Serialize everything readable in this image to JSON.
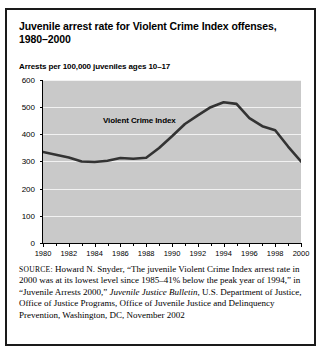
{
  "figure": {
    "title": "Juvenile arrest rate for Violent Crime Index offenses, 1980–2000",
    "axis_note": "Arrests per 100,000 juveniles ages 10–17",
    "series_label": "Violent Crime Index"
  },
  "source": {
    "label": "SOURCE:",
    "text_1": " Howard N. Snyder, “The juvenile Violent Crime Index arrest rate in 2000 was at its lowest level since 1985–41% below the peak year of 1994,” in “Juvenile Arrests 2000,” ",
    "italic_1": "Juvenile Justice Bulletin",
    "text_2": ", U.S. Department of Justice, Office of Justice Programs, Office of Juvenile Justice and Delinquency Prevention, Washington, DC, November 2002"
  },
  "colors": {
    "plot_background": "#c9c9c9",
    "gridline": "#f2f2f2",
    "line": "#333333",
    "border": "#1a1a1a"
  },
  "chart_data": {
    "type": "line",
    "title": "Juvenile arrest rate for Violent Crime Index offenses, 1980–2000",
    "xlabel": "",
    "ylabel": "Arrests per 100,000 juveniles ages 10–17",
    "xlim": [
      1980,
      2000
    ],
    "ylim": [
      0,
      600
    ],
    "yticks": [
      0,
      100,
      200,
      300,
      400,
      500,
      600
    ],
    "xticks": [
      1980,
      1982,
      1984,
      1986,
      1988,
      1990,
      1992,
      1994,
      1996,
      1998,
      2000
    ],
    "xtick_labels": [
      "1980",
      "1982",
      "1984",
      "1986",
      "1988",
      "1990",
      "1992",
      "1994",
      "1996",
      "1998",
      "2000"
    ],
    "ytick_labels": [
      "0",
      "100",
      "200",
      "300",
      "400",
      "500",
      "600"
    ],
    "grid": "horizontal",
    "legend": "inline-label",
    "series": [
      {
        "name": "Violent Crime Index",
        "x": [
          1980,
          1981,
          1982,
          1983,
          1984,
          1985,
          1986,
          1987,
          1988,
          1989,
          1990,
          1991,
          1992,
          1993,
          1994,
          1995,
          1996,
          1997,
          1998,
          1999,
          2000
        ],
        "values": [
          335,
          325,
          315,
          300,
          298,
          303,
          313,
          310,
          314,
          350,
          393,
          438,
          470,
          500,
          518,
          512,
          460,
          430,
          415,
          355,
          300
        ]
      }
    ]
  }
}
